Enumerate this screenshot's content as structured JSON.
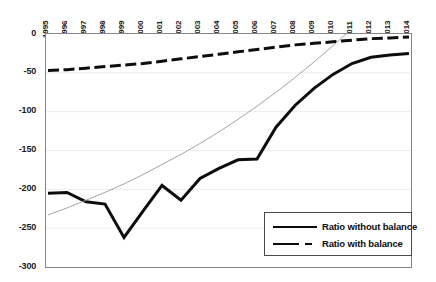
{
  "chart_data": {
    "type": "line",
    "title": "",
    "xlabel": "",
    "ylabel": "",
    "categories": [
      "1995",
      "1996",
      "1997",
      "1998",
      "1999",
      "2000",
      "2001",
      "2002",
      "2003",
      "2004",
      "2005",
      "2006",
      "2007",
      "2008",
      "2009",
      "2010",
      "2011",
      "2012",
      "2013",
      "2014"
    ],
    "ylim": [
      -300,
      0
    ],
    "ytick_labels": [
      "0",
      "-50",
      "-100",
      "-150",
      "-200",
      "-250",
      "-300"
    ],
    "ytick_values": [
      0,
      -50,
      -100,
      -150,
      -200,
      -250,
      -300
    ],
    "grid": true,
    "grid_axis": "y",
    "legend_position": "bottom-right",
    "series": [
      {
        "name": "Ratio without balance",
        "style": "solid",
        "color": "#0d0d0d",
        "values": [
          -205,
          -204,
          -216,
          -219,
          -262,
          -228,
          -195,
          -214,
          -186,
          -173,
          -162,
          -161,
          -120,
          -92,
          -70,
          -52,
          -38,
          -30,
          -27,
          -25
        ]
      },
      {
        "name": "Ratio with balance",
        "style": "dashed",
        "color": "#0d0d0d",
        "values": [
          -47,
          -46,
          -44,
          -42,
          -40,
          -38,
          -35,
          -32,
          -29,
          -26,
          -23,
          -20,
          -17,
          -14,
          -12,
          -10,
          -8,
          -6,
          -5,
          -4
        ]
      },
      {
        "name": "trendline",
        "style": "thin-solid",
        "color": "#9a9a9a",
        "show_in_legend": false,
        "values": [
          -233,
          -224,
          -214,
          -204,
          -193,
          -181,
          -168,
          -155,
          -141,
          -126,
          -110,
          -93,
          -75,
          -56,
          -36,
          -15,
          7,
          30,
          54,
          79
        ]
      }
    ],
    "legend": [
      {
        "label": "Ratio without balance",
        "style": "solid"
      },
      {
        "label": "Ratio with balance",
        "style": "dashed"
      }
    ]
  }
}
